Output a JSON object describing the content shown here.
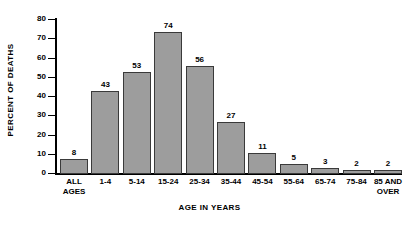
{
  "chart_data": {
    "type": "bar",
    "title": "",
    "xlabel": "AGE IN YEARS",
    "ylabel": "PERCENT OF DEATHS",
    "categories": [
      "ALL AGES",
      "1-4",
      "5-14",
      "15-24",
      "25-34",
      "35-44",
      "45-54",
      "55-64",
      "65-74",
      "75-84",
      "85 AND OVER"
    ],
    "category_lines": [
      [
        "ALL",
        "AGES"
      ],
      [
        "1-4"
      ],
      [
        "5-14"
      ],
      [
        "15-24"
      ],
      [
        "25-34"
      ],
      [
        "35-44"
      ],
      [
        "45-54"
      ],
      [
        "55-64"
      ],
      [
        "65-74"
      ],
      [
        "75-84"
      ],
      [
        "85 AND",
        "OVER"
      ]
    ],
    "values": [
      8,
      43,
      53,
      74,
      56,
      27,
      11,
      5,
      3,
      2,
      2
    ],
    "data_labels": [
      "8",
      "43",
      "53",
      "74",
      "56",
      "27",
      "11",
      "5",
      "3",
      "2",
      "2"
    ],
    "ylim": [
      0,
      80
    ],
    "ytick_values": [
      0,
      10,
      20,
      30,
      40,
      50,
      60,
      70,
      80
    ],
    "ytick_labels": [
      "0",
      "10",
      "20",
      "30",
      "40",
      "50",
      "60",
      "70",
      "80"
    ],
    "grid": false,
    "legend": null,
    "bar_color": "#9d9d9d",
    "bar_edge_color": "#3a3a3a",
    "axis_color": "#000000",
    "background_color": "#ffffff"
  }
}
